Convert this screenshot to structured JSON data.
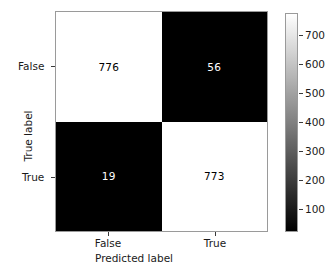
{
  "chart_data": {
    "type": "heatmap",
    "title": "",
    "xlabel": "Predicted label",
    "ylabel": "True label",
    "x_categories": [
      "False",
      "True"
    ],
    "y_categories": [
      "False",
      "True"
    ],
    "matrix": [
      [
        776,
        56
      ],
      [
        19,
        773
      ]
    ],
    "cells": [
      {
        "row": 0,
        "col": 0,
        "value": "776",
        "fill": "#ffffff",
        "text_color": "#000000"
      },
      {
        "row": 0,
        "col": 1,
        "value": "56",
        "fill": "#000000",
        "text_color": "#ffffff"
      },
      {
        "row": 1,
        "col": 0,
        "value": "19",
        "fill": "#000000",
        "text_color": "#ffffff"
      },
      {
        "row": 1,
        "col": 1,
        "value": "773",
        "fill": "#ffffff",
        "text_color": "#000000"
      }
    ],
    "colormap": "gray",
    "colorbar": {
      "ticks": [
        "700",
        "600",
        "500",
        "400",
        "300",
        "200",
        "100"
      ],
      "tick_values": [
        700,
        600,
        500,
        400,
        300,
        200,
        100
      ],
      "vmin": 19,
      "vmax": 776,
      "orientation": "vertical",
      "gradient_top_color": "#ffffff",
      "gradient_bottom_color": "#000000"
    },
    "grid": false,
    "legend": "none"
  },
  "axes": {
    "xlabel": "Predicted label",
    "ylabel": "True label",
    "xticks": [
      "False",
      "True"
    ],
    "yticks": [
      "False",
      "True"
    ]
  },
  "colors": {
    "axis_line": "#9a9a9a",
    "tick_mark": "#3a3a3a",
    "text": "#1a1a1a",
    "background": "#ffffff"
  }
}
